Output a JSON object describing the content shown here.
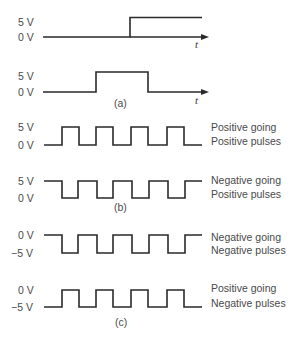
{
  "figure": {
    "panel_a": {
      "caption": "(a)",
      "step": {
        "high_label": "5 V",
        "low_label": "0 V",
        "time_label": "t"
      },
      "pulse": {
        "high_label": "5 V",
        "low_label": "0 V",
        "time_label": "t"
      }
    },
    "panel_b": {
      "caption": "(b)",
      "train1": {
        "high_label": "5 V",
        "low_label": "0 V",
        "desc_line1": "Positive going",
        "desc_line2": "Positive pulses"
      },
      "train2": {
        "high_label": "5 V",
        "low_label": "0 V",
        "desc_line1": "Negative going",
        "desc_line2": "Positive pulses"
      }
    },
    "panel_c": {
      "caption": "(c)",
      "train1": {
        "high_label": "0 V",
        "low_label": "−5 V",
        "desc_line1": "Negative going",
        "desc_line2": "Negative pulses"
      },
      "train2": {
        "high_label": "0 V",
        "low_label": "−5 V",
        "desc_line1": "Positive going",
        "desc_line2": "Negative pulses"
      }
    },
    "colors": {
      "line": "#2a2a2a",
      "text": "#4a4a4a",
      "background": "#ffffff"
    }
  }
}
